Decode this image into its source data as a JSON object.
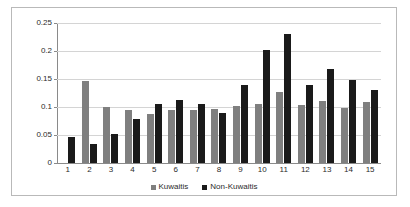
{
  "chart_data": {
    "type": "bar",
    "title": "",
    "subtitle": "",
    "xlabel": "",
    "ylabel": "",
    "ylim": [
      0,
      0.25
    ],
    "yticks": [
      "0",
      "0.05",
      "0.1",
      "0.15",
      "0.2",
      "0.25"
    ],
    "ytick_values": [
      0,
      0.05,
      0.1,
      0.15,
      0.2,
      0.25
    ],
    "grid": true,
    "legend_position": "bottom",
    "categories": [
      "1",
      "2",
      "3",
      "4",
      "5",
      "6",
      "7",
      "8",
      "9",
      "10",
      "11",
      "12",
      "13",
      "14",
      "15"
    ],
    "series": [
      {
        "name": "Kuwaitis",
        "color": "#7f7f7f",
        "values": [
          0,
          0.147,
          0.1,
          0.094,
          0.088,
          0.094,
          0.094,
          0.096,
          0.102,
          0.105,
          0.127,
          0.103,
          0.11,
          0.098,
          0.109
        ]
      },
      {
        "name": "Non-Kuwaitis",
        "color": "#1a1a1a",
        "values": [
          0.047,
          0.034,
          0.051,
          0.078,
          0.106,
          0.113,
          0.106,
          0.09,
          0.14,
          0.201,
          0.23,
          0.14,
          0.167,
          0.149,
          0.13
        ]
      }
    ]
  },
  "legend": {
    "items": [
      {
        "label": "Kuwaitis"
      },
      {
        "label": "Non-Kuwaitis"
      }
    ]
  },
  "colors": {
    "kuwaitis": "#7f7f7f",
    "non_kuwaitis": "#1a1a1a",
    "gridline": "#d4d4d4",
    "axis": "#8a8a8a",
    "border": "#b9b9b9",
    "background": "#ffffff",
    "text": "#2b2b2b"
  }
}
